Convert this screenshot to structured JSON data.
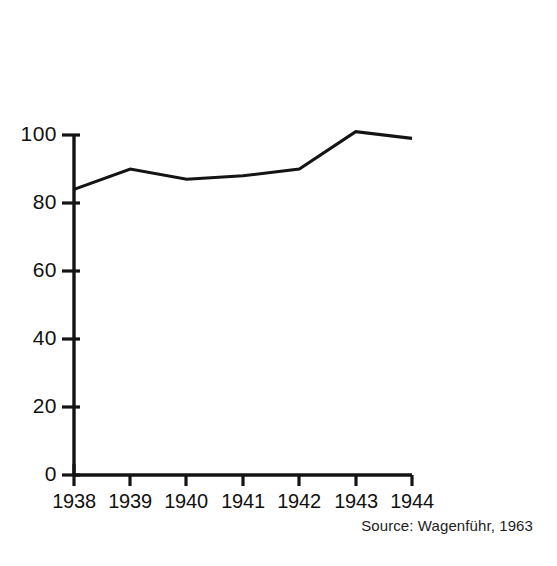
{
  "chart_data": {
    "type": "line",
    "title": "",
    "subtitle": "",
    "xlabel": "",
    "ylabel": "",
    "categories": [
      "1938",
      "1939",
      "1940",
      "1941",
      "1942",
      "1943",
      "1944"
    ],
    "x": [
      1938,
      1939,
      1940,
      1941,
      1942,
      1943,
      1944
    ],
    "values": [
      84,
      90,
      87,
      88,
      90,
      101,
      99
    ],
    "series": [
      {
        "name": "index",
        "values": [
          84,
          90,
          87,
          88,
          90,
          101,
          99
        ]
      }
    ],
    "ylim": [
      0,
      110
    ],
    "xlim": [
      1938,
      1944
    ],
    "ytick_labels": [
      "100",
      "80",
      "60",
      "40",
      "20",
      "0"
    ],
    "ytick_values": [
      100,
      80,
      60,
      40,
      20,
      0
    ],
    "xtick_labels": [
      "1938",
      "1939",
      "1940",
      "1941",
      "1942",
      "1943",
      "1944"
    ],
    "grid": false,
    "legend": false,
    "legend_position": "none",
    "line_color": "#141414",
    "axis_color": "#141414",
    "background_color": "#ffffff",
    "annotations": [
      "Source: Wagenführ, 1963"
    ]
  },
  "source_note": "Source: Wagenführ, 1963"
}
